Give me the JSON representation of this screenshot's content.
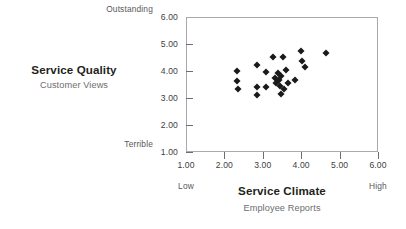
{
  "chart_data": {
    "type": "scatter",
    "title": "",
    "xlabel": "Service Climate",
    "xsublabel": "Employee Reports",
    "ylabel": "Service Quality",
    "ysublabel": "Customer Views",
    "xlim": [
      1.0,
      6.0
    ],
    "ylim": [
      1.0,
      6.0
    ],
    "grid": false,
    "legend": null,
    "marker": "diamond",
    "marker_color": "#1a1a1a",
    "x_ticks": [
      "1.00",
      "2.00",
      "3.00",
      "4.00",
      "5.00",
      "6.00"
    ],
    "y_ticks": [
      "1.00",
      "2.00",
      "3.00",
      "4.00",
      "5.00",
      "6.00"
    ],
    "x_tick_values": [
      1,
      2,
      3,
      4,
      5,
      6
    ],
    "y_tick_values": [
      1,
      2,
      3,
      4,
      5,
      6
    ],
    "x_anchor_low": "Low",
    "x_anchor_high": "High",
    "y_anchor_high": "Outstanding",
    "y_anchor_low": "Terrible",
    "points": [
      {
        "x": 2.31,
        "y": 4.04
      },
      {
        "x": 2.31,
        "y": 3.67
      },
      {
        "x": 2.33,
        "y": 3.37
      },
      {
        "x": 2.83,
        "y": 4.26
      },
      {
        "x": 2.83,
        "y": 3.44
      },
      {
        "x": 2.83,
        "y": 3.15
      },
      {
        "x": 3.05,
        "y": 4.0
      },
      {
        "x": 3.05,
        "y": 3.44
      },
      {
        "x": 3.25,
        "y": 4.56
      },
      {
        "x": 3.29,
        "y": 3.78
      },
      {
        "x": 3.33,
        "y": 3.59
      },
      {
        "x": 3.37,
        "y": 3.96
      },
      {
        "x": 3.4,
        "y": 3.7
      },
      {
        "x": 3.42,
        "y": 3.48
      },
      {
        "x": 3.44,
        "y": 3.19
      },
      {
        "x": 3.46,
        "y": 3.85
      },
      {
        "x": 3.5,
        "y": 4.56
      },
      {
        "x": 3.52,
        "y": 3.37
      },
      {
        "x": 3.58,
        "y": 4.07
      },
      {
        "x": 3.62,
        "y": 3.59
      },
      {
        "x": 3.81,
        "y": 3.7
      },
      {
        "x": 3.98,
        "y": 4.78
      },
      {
        "x": 4.0,
        "y": 4.41
      },
      {
        "x": 4.08,
        "y": 4.19
      },
      {
        "x": 4.62,
        "y": 4.7
      }
    ]
  },
  "axes": {
    "x": {
      "title": "Service Climate",
      "subtitle": "Employee Reports",
      "anchor_low": "Low",
      "anchor_high": "High",
      "tick_labels": [
        "1.00",
        "2.00",
        "3.00",
        "4.00",
        "5.00",
        "6.00"
      ]
    },
    "y": {
      "title": "Service Quality",
      "subtitle": "Customer Views",
      "anchor_high": "Outstanding",
      "anchor_low": "Terrible",
      "tick_labels": [
        "1.00",
        "2.00",
        "3.00",
        "4.00",
        "5.00",
        "6.00"
      ]
    }
  },
  "colors": {
    "marker": "#1a1a1a",
    "frame": "#a7a9ac",
    "title_text": "#231f20",
    "subtitle_text": "#6d6e71",
    "tick_text": "#414042"
  }
}
